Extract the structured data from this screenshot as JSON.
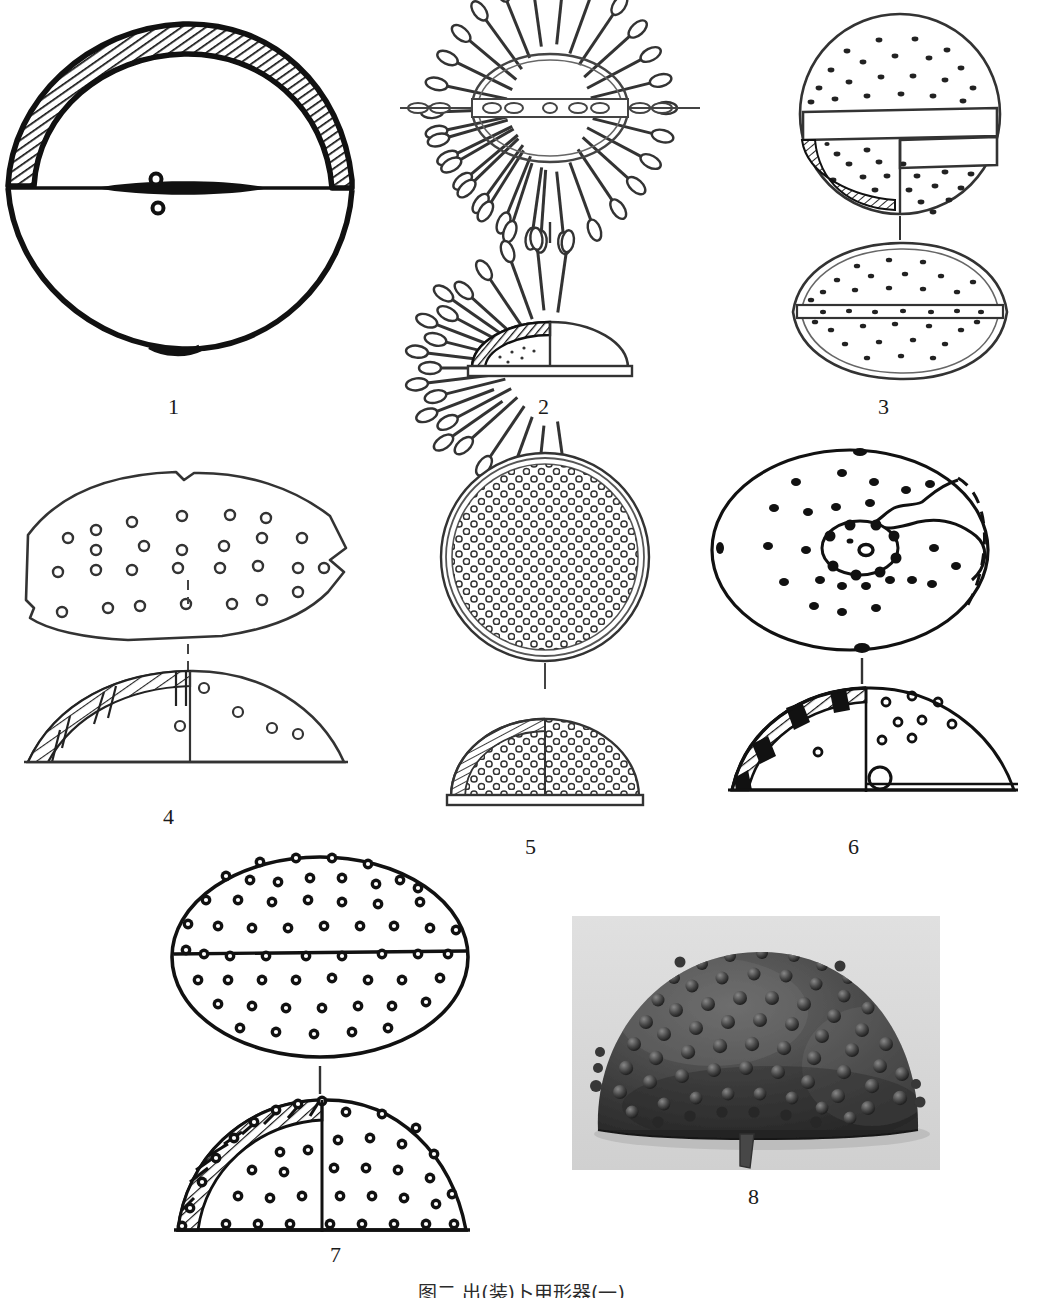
{
  "plate": {
    "caption": "图二  出(装)卜甲形器(一)",
    "caption_note": "bottom caption line is clipped by the page edge",
    "background_color": "#ffffff",
    "ink_color": "#111111"
  },
  "figures": [
    {
      "id": "fig-1",
      "label": "1",
      "title": "Lens-shaped test, vertical section",
      "views": [
        "section"
      ],
      "features": [
        "hatched shell wall",
        "central perforation",
        "lenticular outline"
      ]
    },
    {
      "id": "fig-2",
      "label": "2",
      "title": "Spined echinoid, plan and section",
      "views": [
        "plan",
        "section"
      ],
      "features": [
        "radiating club-tipped spines",
        "hatched wall segment",
        "stippled interior"
      ]
    },
    {
      "id": "fig-3",
      "label": "3",
      "title": "Tuberculate dome with banding, plan and section",
      "views": [
        "plan",
        "section"
      ],
      "features": [
        "dot-covered surface",
        "horizontal band",
        "hatched quarter",
        "lenticular profile"
      ]
    },
    {
      "id": "fig-4",
      "label": "4",
      "title": "Perforated fragment, plan and section",
      "views": [
        "plan",
        "section"
      ],
      "features": [
        "irregular broken outline",
        "circular perforations",
        "hatched wall"
      ]
    },
    {
      "id": "fig-5",
      "label": "5",
      "title": "Densely tuberculate hemisphere, plan and section",
      "views": [
        "plan",
        "section"
      ],
      "features": [
        "dense ring tubercles",
        "double rim line",
        "hatched wall edge"
      ]
    },
    {
      "id": "fig-6",
      "label": "6",
      "title": "Oval test with central boss, plan and section",
      "views": [
        "plan",
        "section"
      ],
      "features": [
        "central rosette boss",
        "broken edge shown dashed",
        "solid-black and hatched wall",
        "basal perforation"
      ]
    },
    {
      "id": "fig-7",
      "label": "7",
      "title": "Oval tuberculate test, plan and section",
      "views": [
        "plan",
        "section"
      ],
      "features": [
        "ringed tubercles in rows",
        "equatorial line",
        "hatched and ribbed wall"
      ]
    },
    {
      "id": "fig-8",
      "label": "8",
      "title": "Photograph of tuberculate hemispherical test",
      "views": [
        "photograph"
      ],
      "features": [
        "dark knobbed surface",
        "pale ground",
        "protruding stub at base"
      ]
    }
  ]
}
